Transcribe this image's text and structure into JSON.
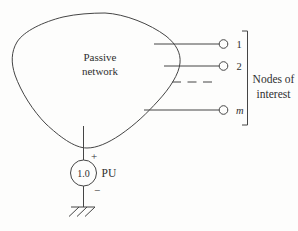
{
  "diagram": {
    "network": {
      "line1": "Passive",
      "line2": "network"
    },
    "nodes": [
      {
        "label": "1"
      },
      {
        "label": "2"
      },
      {
        "label": "m"
      }
    ],
    "ellipsis": "dashed continuation between node 2 and node m",
    "bracket_label": {
      "line1": "Nodes of",
      "line2": "interest"
    },
    "source": {
      "value": "1.0",
      "unit": "PU",
      "plus": "+",
      "minus": "−"
    }
  },
  "colors": {
    "stroke": "#454545",
    "text": "#2f2f2f",
    "background": "#fdfdfc"
  }
}
